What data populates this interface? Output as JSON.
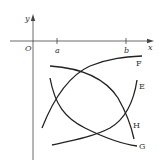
{
  "diagram": {
    "axes": {
      "x_label": "x",
      "y_label": "y",
      "origin_label": "O",
      "ticks": [
        {
          "label": "a"
        },
        {
          "label": "b"
        }
      ]
    },
    "curves": [
      {
        "name": "F",
        "label": "F"
      },
      {
        "name": "E",
        "label": "E"
      },
      {
        "name": "H",
        "label": "H"
      },
      {
        "name": "G",
        "label": "G"
      }
    ],
    "colors": {
      "stroke": "#222222",
      "axis": "#444444",
      "text": "#333333"
    }
  }
}
